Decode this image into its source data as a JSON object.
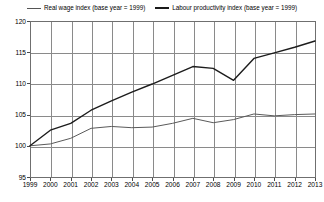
{
  "chart_data": {
    "type": "line",
    "title": "",
    "xlabel": "",
    "ylabel": "",
    "x": [
      1999,
      2000,
      2001,
      2002,
      2003,
      2004,
      2005,
      2006,
      2007,
      2008,
      2009,
      2010,
      2011,
      2012,
      2013
    ],
    "categories": [
      "1999",
      "2000",
      "2001",
      "2002",
      "2003",
      "2004",
      "2005",
      "2006",
      "2007",
      "2008",
      "2009",
      "2010",
      "2011",
      "2012",
      "2013"
    ],
    "xlim": [
      1999,
      2013
    ],
    "ylim": [
      95,
      120
    ],
    "yticks": [
      95,
      100,
      105,
      110,
      115,
      120
    ],
    "ytick_labels": [
      "95",
      "100",
      "105",
      "110",
      "115",
      "120"
    ],
    "grid": true,
    "legend_position": "top",
    "series": [
      {
        "name": "Real wage index (base year = 1999)",
        "color": "#5a5a5a",
        "values": [
          100.0,
          100.3,
          101.2,
          102.8,
          103.1,
          102.9,
          103.0,
          103.6,
          104.4,
          103.7,
          104.2,
          105.1,
          104.8,
          105.0,
          105.1
        ]
      },
      {
        "name": "Labour productivity index (base year = 1999)",
        "color": "#1c1c1c",
        "values": [
          100.0,
          102.5,
          103.6,
          105.7,
          107.2,
          108.6,
          109.9,
          111.3,
          112.7,
          112.4,
          110.5,
          114.0,
          114.9,
          115.8,
          116.8
        ]
      }
    ]
  },
  "legend": {
    "entries": [
      {
        "label": "Real wage index (base year = 1999)",
        "swatch": "line-swatch-thin"
      },
      {
        "label": "Labour productivity index (base year = 1999)",
        "swatch": "line-swatch-thick"
      }
    ]
  }
}
